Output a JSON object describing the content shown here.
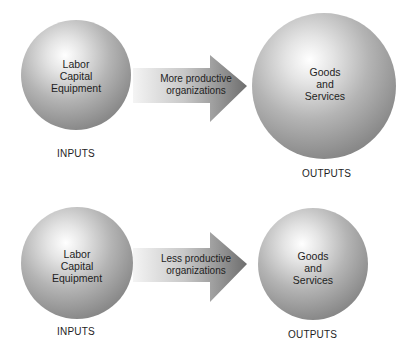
{
  "rows": [
    {
      "inputs": {
        "lines": [
          "Labor",
          "Capital",
          "Equipment"
        ],
        "label": "INPUTS"
      },
      "process": {
        "lines": [
          "More productive",
          "organizations"
        ]
      },
      "outputs": {
        "lines": [
          "Goods",
          "and",
          "Services"
        ],
        "label": "OUTPUTS"
      }
    },
    {
      "inputs": {
        "lines": [
          "Labor",
          "Capital",
          "Equipment"
        ],
        "label": "INPUTS"
      },
      "process": {
        "lines": [
          "Less productive",
          "organizations"
        ]
      },
      "outputs": {
        "lines": [
          "Goods",
          "and",
          "Services"
        ],
        "label": "OUTPUTS"
      }
    }
  ]
}
